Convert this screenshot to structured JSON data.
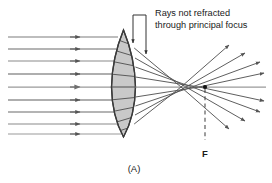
{
  "figure": {
    "caption": "(A)",
    "annotation": {
      "line1": "Rays not refracted",
      "line2": "through principal focus"
    },
    "focus_label": "F",
    "colors": {
      "ray": "#555555",
      "ray_light": "#8a8a8a",
      "lens_fill": "#c9c9c9",
      "lens_stroke": "#3a3a3a",
      "text": "#1a1a1a",
      "background": "#ffffff"
    }
  },
  "diagram_data": {
    "type": "optics-ray-diagram",
    "lens": {
      "kind": "biconvex",
      "center_x": 123.5,
      "top_y": 30,
      "bottom_y": 137,
      "half_thickness": 11.5
    },
    "axis_y": 87,
    "focus": {
      "x": 205,
      "y": 87,
      "label": "F"
    },
    "incoming_ray_count": 9,
    "incoming_ray_y": [
      37,
      49,
      61,
      74,
      87,
      100,
      112,
      124,
      134
    ],
    "incoming_ray_x_start": 8,
    "incoming_arrow_x": 78,
    "crossing_zone": {
      "x_start": 178,
      "x_end": 212
    },
    "outgoing_ray_count": 9,
    "dashed_focus_line": {
      "x": 205,
      "y_top": 87,
      "y_bottom": 140
    },
    "pointer_bracket": {
      "x_left": 133,
      "x_right": 146,
      "y_top": 15
    }
  }
}
